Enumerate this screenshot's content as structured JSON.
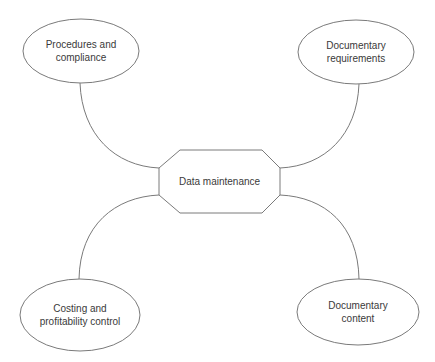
{
  "diagram": {
    "type": "mind-map",
    "center": {
      "label": "Data maintenance"
    },
    "nodes": [
      {
        "id": "top-left",
        "line1": "Procedures and",
        "line2": "compliance"
      },
      {
        "id": "top-right",
        "line1": "Documentary",
        "line2": "requirements"
      },
      {
        "id": "bottom-left",
        "line1": "Costing and",
        "line2": "profitability control"
      },
      {
        "id": "bottom-right",
        "line1": "Documentary",
        "line2": "content"
      }
    ],
    "colors": {
      "stroke": "#7a7a7a",
      "text": "#3a3a3a",
      "background": "#ffffff"
    }
  }
}
